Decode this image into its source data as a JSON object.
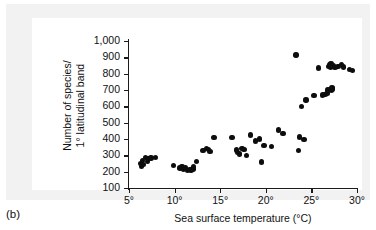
{
  "figure": {
    "caption": "(b)",
    "panel_background": "#f2f2f2",
    "plot_background": "#ffffff",
    "marker_color": "#0d0d0d",
    "axis_color": "#1a1a1a"
  },
  "chart_data": {
    "type": "scatter",
    "title": "",
    "xlabel": "Sea surface temperature (°C)",
    "ylabel": "Number of species/\n1° latitudinal band",
    "ylabel_line1": "Number of species/",
    "ylabel_line2": "1° latitudinal band",
    "xlim": [
      5,
      30
    ],
    "ylim": [
      100,
      1000
    ],
    "grid": false,
    "legend": null,
    "xticks": [
      5,
      10,
      15,
      20,
      25,
      30
    ],
    "xtick_labels": [
      "5°",
      "10°",
      "15°",
      "20°",
      "25°",
      "30°"
    ],
    "yticks": [
      100,
      200,
      300,
      400,
      500,
      600,
      700,
      800,
      900,
      1000
    ],
    "ytick_labels": [
      "100",
      "200",
      "300",
      "400",
      "500",
      "600",
      "700",
      "800",
      "900",
      "1,000"
    ],
    "points": [
      [
        6.3,
        250
      ],
      [
        6.4,
        232
      ],
      [
        6.5,
        268
      ],
      [
        6.6,
        243
      ],
      [
        6.8,
        285
      ],
      [
        7.0,
        262
      ],
      [
        7.1,
        281
      ],
      [
        7.4,
        283
      ],
      [
        7.9,
        286
      ],
      [
        9.9,
        236
      ],
      [
        10.6,
        222
      ],
      [
        10.8,
        231
      ],
      [
        11.0,
        214
      ],
      [
        11.2,
        226
      ],
      [
        11.4,
        208
      ],
      [
        11.6,
        212
      ],
      [
        11.8,
        210
      ],
      [
        12.0,
        216
      ],
      [
        12.1,
        228
      ],
      [
        12.4,
        262
      ],
      [
        13.1,
        330
      ],
      [
        13.5,
        341
      ],
      [
        13.7,
        336
      ],
      [
        13.9,
        322
      ],
      [
        14.3,
        410
      ],
      [
        16.3,
        410
      ],
      [
        16.8,
        332
      ],
      [
        16.9,
        318
      ],
      [
        17.1,
        308
      ],
      [
        17.4,
        342
      ],
      [
        17.6,
        336
      ],
      [
        17.9,
        298
      ],
      [
        18.3,
        424
      ],
      [
        18.9,
        388
      ],
      [
        19.3,
        400
      ],
      [
        19.5,
        260
      ],
      [
        19.8,
        360
      ],
      [
        20.6,
        355
      ],
      [
        21.4,
        456
      ],
      [
        21.9,
        434
      ],
      [
        23.3,
        915
      ],
      [
        23.6,
        330
      ],
      [
        23.7,
        412
      ],
      [
        23.9,
        600
      ],
      [
        24.2,
        396
      ],
      [
        24.4,
        640
      ],
      [
        25.3,
        668
      ],
      [
        25.8,
        835
      ],
      [
        26.2,
        670
      ],
      [
        26.5,
        672
      ],
      [
        26.7,
        678
      ],
      [
        26.8,
        700
      ],
      [
        26.9,
        845
      ],
      [
        27.0,
        855
      ],
      [
        27.1,
        840
      ],
      [
        27.15,
        862
      ],
      [
        27.2,
        700
      ],
      [
        27.25,
        712
      ],
      [
        27.3,
        706
      ],
      [
        27.4,
        848
      ],
      [
        27.6,
        836
      ],
      [
        27.9,
        844
      ],
      [
        28.3,
        858
      ],
      [
        28.5,
        840
      ],
      [
        29.2,
        826
      ],
      [
        29.5,
        818
      ]
    ]
  }
}
